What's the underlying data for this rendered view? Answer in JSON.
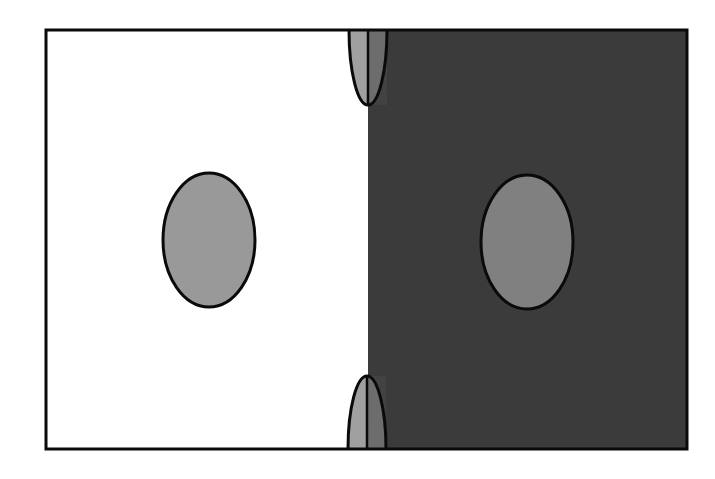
{
  "diagram": {
    "type": "simultaneous-contrast-illusion",
    "canvas": {
      "width": 715,
      "height": 479,
      "background": "#ffffff"
    },
    "frame": {
      "x": 46,
      "y": 30,
      "width": 641,
      "height": 419,
      "stroke": "#0a0a0a",
      "stroke_width": 3
    },
    "regions": {
      "light": {
        "x": 46,
        "y": 30,
        "width": 322,
        "height": 419,
        "fill": "#ffffff"
      },
      "dark": {
        "x": 368,
        "y": 30,
        "width": 319,
        "height": 419,
        "fill": "#3c3c3c"
      }
    },
    "divider_x": 368,
    "ellipses": [
      {
        "id": "left-ellipse",
        "cx": 209,
        "cy": 240,
        "rx": 46,
        "ry": 67,
        "fill": "#999999",
        "stroke": "#0a0a0a",
        "stroke_width": 3
      },
      {
        "id": "right-ellipse",
        "cx": 527,
        "cy": 242,
        "rx": 46,
        "ry": 67,
        "fill": "#808080",
        "stroke": "#0a0a0a",
        "stroke_width": 3
      }
    ],
    "half_ellipses": [
      {
        "id": "top-half-ellipse",
        "cx": 368,
        "edge_y": 30,
        "tip_y": 105,
        "rx": 19,
        "fill_light_side": "#a0a0a0",
        "fill_dark_side": "#6e6e6e"
      },
      {
        "id": "bottom-half-ellipse",
        "cx": 367,
        "edge_y": 449,
        "tip_y": 376,
        "rx": 19,
        "fill_light_side": "#a0a0a0",
        "fill_dark_side": "#6e6e6e"
      }
    ],
    "text_labels": []
  }
}
